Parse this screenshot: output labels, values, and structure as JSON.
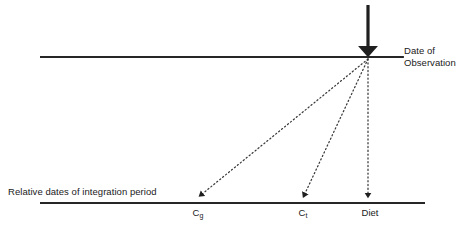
{
  "figure": {
    "type": "diagram",
    "title_visible": false,
    "background_color": "#ffffff",
    "line_color": "#262626",
    "dotted_color": "#3a3a3a",
    "text_color": "#1a1a1a",
    "timelines": [
      {
        "name": "observation-timeline",
        "label_line1": "Date of",
        "label_line2": "Observation",
        "y": 57,
        "x_start": 40,
        "x_end": 403
      },
      {
        "name": "integration-timeline",
        "label": "Relative dates of integration period",
        "y": 203,
        "x_start": 40,
        "x_end": 425
      }
    ],
    "observation_marker": {
      "name": "observation-arrow",
      "x": 368,
      "y_start": 5,
      "y_end": 57,
      "style": "thick-solid-down-arrow"
    },
    "convergence_point": {
      "x": 368,
      "y": 59
    },
    "projections": [
      {
        "name": "projection-cg",
        "label": "C",
        "subscript": "g",
        "target_x": 198,
        "target_y": 201,
        "style": "dotted"
      },
      {
        "name": "projection-ct",
        "label": "C",
        "subscript": "t",
        "target_x": 303,
        "target_y": 201,
        "style": "dotted"
      },
      {
        "name": "projection-diet",
        "label": "Diet",
        "subscript": "",
        "target_x": 368,
        "target_y": 201,
        "style": "dotted"
      }
    ]
  }
}
